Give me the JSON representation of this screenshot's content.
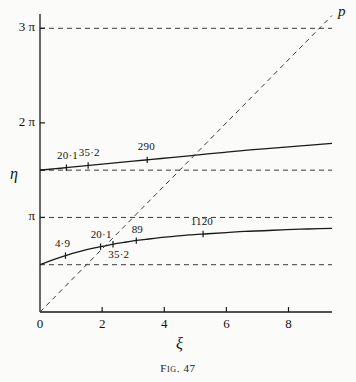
{
  "figure": {
    "caption": "Fig. 47",
    "xlabel": "ξ",
    "ylabel": "η",
    "diagonal_label": "p"
  },
  "axes": {
    "x_ticks": [
      {
        "label": "0",
        "value": 0
      },
      {
        "label": "2",
        "value": 2
      },
      {
        "label": "4",
        "value": 4
      },
      {
        "label": "6",
        "value": 6
      },
      {
        "label": "8",
        "value": 8
      }
    ],
    "y_ticks": [
      {
        "label": "3 π",
        "value": 9.4248
      },
      {
        "label": "2 π",
        "value": 6.2832
      },
      {
        "label": "π",
        "value": 3.1416
      }
    ],
    "xlim": [
      0,
      9.4
    ],
    "ylim": [
      0,
      9.9
    ],
    "x_minor_ticks": [
      1,
      3,
      5,
      7,
      9
    ],
    "y_minor_ticks": [
      4.7124
    ]
  },
  "chart_data": {
    "type": "line",
    "title": "Fig. 47",
    "xlabel": "ξ",
    "ylabel": "η",
    "xlim": [
      0,
      9.4
    ],
    "ylim": [
      0,
      9.9
    ],
    "grid": false,
    "legend": "none",
    "series": [
      {
        "name": "lower-branch",
        "type": "line",
        "style": "solid",
        "x": [
          0.0,
          0.3,
          0.6,
          0.9,
          1.2,
          1.5,
          1.8,
          2.1,
          2.4,
          2.7,
          3.0,
          3.4,
          3.8,
          4.3,
          4.8,
          5.4,
          6.0,
          6.6,
          7.2,
          7.8,
          8.4,
          9.0,
          9.4
        ],
        "y": [
          1.5708,
          1.69,
          1.8,
          1.9,
          1.99,
          2.07,
          2.14,
          2.2,
          2.26,
          2.31,
          2.36,
          2.41,
          2.46,
          2.51,
          2.56,
          2.6,
          2.64,
          2.68,
          2.7,
          2.73,
          2.75,
          2.77,
          2.78
        ]
      },
      {
        "name": "upper-branch",
        "type": "line",
        "style": "solid",
        "x": [
          0.0,
          0.5,
          1.0,
          1.5,
          2.0,
          2.5,
          3.0,
          3.6,
          4.2,
          4.8,
          5.4,
          6.0,
          6.6,
          7.2,
          7.8,
          8.4,
          9.0,
          9.4
        ],
        "y": [
          4.7124,
          4.76,
          4.81,
          4.86,
          4.91,
          4.96,
          5.01,
          5.07,
          5.13,
          5.19,
          5.25,
          5.31,
          5.37,
          5.42,
          5.47,
          5.52,
          5.57,
          5.6
        ]
      },
      {
        "name": "diagonal-p",
        "type": "line",
        "style": "dashed",
        "x": [
          0.0,
          9.4
        ],
        "y": [
          0.0,
          9.85
        ]
      }
    ],
    "reference_lines": [
      {
        "name": "3pi",
        "orientation": "horizontal",
        "value": 9.4248,
        "style": "dashed"
      },
      {
        "name": "5pi/2",
        "orientation": "horizontal",
        "value": 4.7124,
        "style": "dashed"
      },
      {
        "name": "pi",
        "orientation": "horizontal",
        "value": 3.1416,
        "style": "dashed"
      },
      {
        "name": "pi/2",
        "orientation": "horizontal",
        "value": 1.5708,
        "style": "dashed"
      }
    ],
    "annotations": [
      {
        "text": "20·1",
        "series": "upper-branch",
        "x": 0.85,
        "y": 4.79,
        "tx": 0.55,
        "ty": 5.18
      },
      {
        "text": "35·2",
        "series": "upper-branch",
        "x": 1.55,
        "y": 4.86,
        "tx": 1.25,
        "ty": 5.28
      },
      {
        "text": "290",
        "series": "upper-branch",
        "x": 3.45,
        "y": 5.06,
        "tx": 3.15,
        "ty": 5.47
      },
      {
        "text": "4·9",
        "series": "lower-branch",
        "x": 0.82,
        "y": 1.89,
        "tx": 0.48,
        "ty": 2.26
      },
      {
        "text": "20·1",
        "series": "lower-branch",
        "x": 1.95,
        "y": 2.18,
        "tx": 1.63,
        "ty": 2.57
      },
      {
        "text": "35·2",
        "series": "lower-branch",
        "x": 2.35,
        "y": 2.26,
        "tx": 2.2,
        "ty": 1.88
      },
      {
        "text": "89",
        "series": "lower-branch",
        "x": 3.1,
        "y": 2.39,
        "tx": 2.95,
        "ty": 2.72
      },
      {
        "text": "1120",
        "series": "lower-branch",
        "x": 5.25,
        "y": 2.62,
        "tx": 4.85,
        "ty": 3.0
      }
    ]
  },
  "style": {
    "axis_color": "#1a1a1a",
    "curve_color": "#1a1a1a",
    "dash_color": "#3a3a3a",
    "background": "#fbfbf9"
  }
}
